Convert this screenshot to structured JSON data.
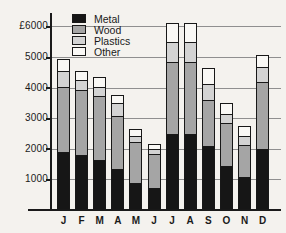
{
  "chart_data": {
    "type": "bar",
    "stacked": true,
    "title": "",
    "currency_prefix": "£",
    "categories": [
      "J",
      "F",
      "M",
      "A",
      "M",
      "J",
      "J",
      "A",
      "S",
      "O",
      "N",
      "D"
    ],
    "series": [
      {
        "name": "Metal",
        "color": "#161616",
        "values": [
          1900,
          1800,
          1650,
          1350,
          900,
          750,
          2500,
          2500,
          2100,
          1450,
          1100,
          2000
        ]
      },
      {
        "name": "Wood",
        "color": "#a5a5a5",
        "values": [
          2150,
          2150,
          2100,
          1750,
          1350,
          1100,
          2350,
          2350,
          1500,
          1400,
          1050,
          2200
        ]
      },
      {
        "name": "Plastics",
        "color": "#d3d3d3",
        "values": [
          500,
          300,
          300,
          400,
          200,
          150,
          650,
          650,
          550,
          300,
          300,
          500
        ]
      },
      {
        "name": "Other",
        "color": "#f9f8f5",
        "values": [
          400,
          300,
          300,
          250,
          200,
          150,
          600,
          600,
          500,
          350,
          300,
          350
        ]
      }
    ],
    "totals": [
      4950,
      4550,
      4350,
      3750,
      2650,
      2150,
      6100,
      6100,
      4650,
      3500,
      2750,
      5050
    ],
    "ylim": [
      0,
      6000
    ],
    "ytick_step": 1000,
    "ytick_values": [
      1000,
      2000,
      3000,
      4000,
      5000,
      6000
    ],
    "ytick_labels": [
      "1000",
      "2000",
      "3000",
      "4000",
      "5000",
      "£6000"
    ],
    "xlabel": "",
    "ylabel": "£",
    "grid": true,
    "legend_position": "top-left",
    "legend_entries": [
      "Metal",
      "Wood",
      "Plastics",
      "Other"
    ]
  },
  "colors": {
    "background": "#f4f2ee",
    "axis": "#1a1a1a",
    "gridline": "#8f8f8f",
    "text": "#1a1a1a"
  }
}
